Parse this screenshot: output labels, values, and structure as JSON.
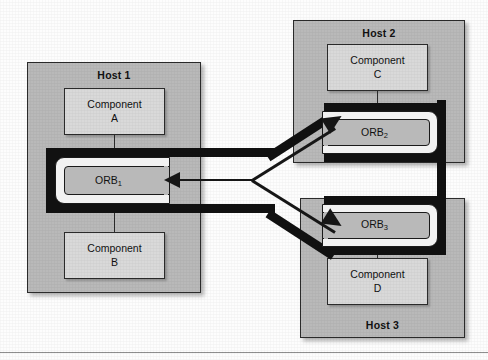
{
  "diagram": {
    "colors": {
      "host_fill": "#b9b9b9",
      "component_fill": "#d9d9d9",
      "bus_black": "#111111",
      "outline": "#2b2b2b",
      "page_background": "#fdfdfd"
    },
    "hosts": [
      {
        "id": "host1",
        "label": "Host 1",
        "label_position": "top"
      },
      {
        "id": "host2",
        "label": "Host 2",
        "label_position": "top"
      },
      {
        "id": "host3",
        "label": "Host 3",
        "label_position": "bottom"
      }
    ],
    "components": [
      {
        "id": "componentA",
        "name": "Component",
        "letter": "A",
        "host": "Host 1"
      },
      {
        "id": "componentB",
        "name": "Component",
        "letter": "B",
        "host": "Host 1"
      },
      {
        "id": "componentC",
        "name": "Component",
        "letter": "C",
        "host": "Host 2"
      },
      {
        "id": "componentD",
        "name": "Component",
        "letter": "D",
        "host": "Host 3"
      }
    ],
    "orbs": [
      {
        "id": "orb1",
        "name": "ORB",
        "index": "1",
        "host": "Host 1",
        "opens": "right"
      },
      {
        "id": "orb2",
        "name": "ORB",
        "index": "2",
        "host": "Host 2",
        "opens": "left"
      },
      {
        "id": "orb3",
        "name": "ORB",
        "index": "3",
        "host": "Host 3",
        "opens": "left"
      }
    ],
    "connections": [
      {
        "from": "ORB1",
        "to": "ORB2",
        "style": "thick-bus"
      },
      {
        "from": "ORB1",
        "to": "ORB3",
        "style": "thick-bus"
      },
      {
        "from": "ORB2",
        "to": "ORB3",
        "style": "thick-bus"
      },
      {
        "from": "junction",
        "to": "ORB1",
        "style": "thin-arrow",
        "direction": "left"
      },
      {
        "from": "junction",
        "to": "ORB2",
        "style": "thin-arrow",
        "direction": "up-right"
      },
      {
        "from": "junction",
        "to": "ORB3",
        "style": "thin-arrow",
        "direction": "down-right"
      }
    ]
  }
}
